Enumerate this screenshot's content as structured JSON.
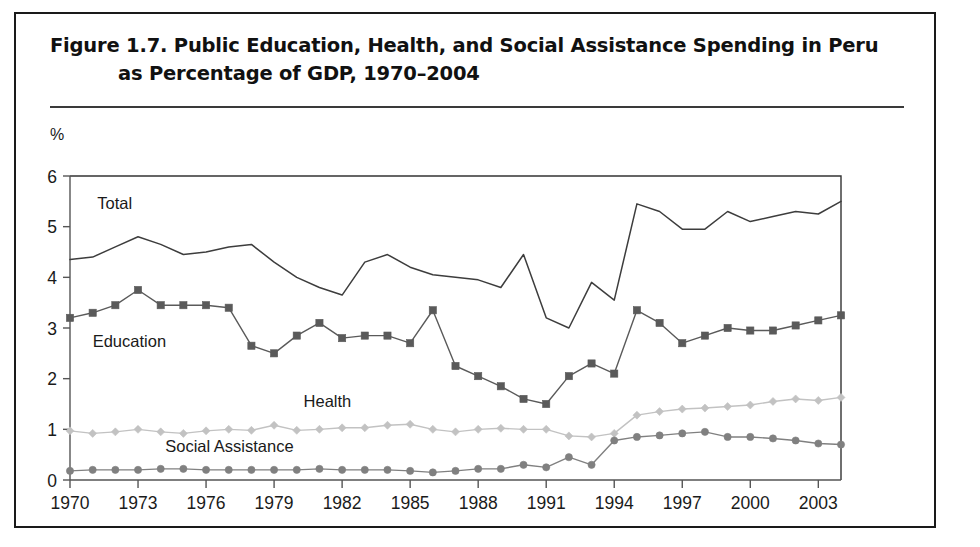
{
  "figure": {
    "title_line_1": "Figure 1.7.  Public Education, Health, and Social Assistance Spending in Peru",
    "title_line_2": "as Percentage of GDP, 1970–2004"
  },
  "chart_data": {
    "type": "line",
    "title": "Public Education, Health, and Social Assistance Spending in Peru as Percentage of GDP, 1970–2004",
    "xlabel": "",
    "ylabel": "%",
    "y_unit_label": "%",
    "xlim": [
      1970,
      2004
    ],
    "ylim": [
      0,
      6
    ],
    "y_ticks": [
      0,
      1,
      2,
      3,
      4,
      5,
      6
    ],
    "y_tick_labels": [
      "0",
      "1",
      "2",
      "3",
      "4",
      "5",
      "6"
    ],
    "x_ticks": [
      1970,
      1973,
      1976,
      1979,
      1982,
      1985,
      1988,
      1991,
      1994,
      1997,
      2000,
      2003
    ],
    "x_tick_labels": [
      "1970",
      "1973",
      "1976",
      "1979",
      "1982",
      "1985",
      "1988",
      "1991",
      "1994",
      "1997",
      "2000",
      "2003"
    ],
    "grid": false,
    "legend_position": "inline-annotations",
    "x": [
      1970,
      1971,
      1972,
      1973,
      1974,
      1975,
      1976,
      1977,
      1978,
      1979,
      1980,
      1981,
      1982,
      1983,
      1984,
      1985,
      1986,
      1987,
      1988,
      1989,
      1990,
      1991,
      1992,
      1993,
      1994,
      1995,
      1996,
      1997,
      1998,
      1999,
      2000,
      2001,
      2002,
      2003,
      2004
    ],
    "series": [
      {
        "name": "Total",
        "label": "Total",
        "color": "#3d3d3d",
        "marker": "none",
        "values": [
          4.35,
          4.4,
          4.6,
          4.8,
          4.65,
          4.45,
          4.5,
          4.6,
          4.65,
          4.3,
          4.0,
          3.8,
          3.65,
          4.3,
          4.45,
          4.2,
          4.05,
          4.0,
          3.95,
          3.8,
          4.45,
          3.2,
          3.0,
          3.9,
          3.55,
          5.45,
          5.3,
          4.95,
          4.95,
          5.3,
          5.1,
          5.2,
          5.3,
          5.25,
          5.5
        ]
      },
      {
        "name": "Education",
        "label": "Education",
        "color": "#5a5a5a",
        "marker": "square",
        "values": [
          3.2,
          3.3,
          3.45,
          3.75,
          3.45,
          3.45,
          3.45,
          3.4,
          2.65,
          2.5,
          2.85,
          3.1,
          2.8,
          2.85,
          2.85,
          2.7,
          3.35,
          2.25,
          2.05,
          1.85,
          1.6,
          1.5,
          2.05,
          2.3,
          2.1,
          3.35,
          3.1,
          2.7,
          2.85,
          3.0,
          2.95,
          2.95,
          3.05,
          3.15,
          3.25
        ]
      },
      {
        "name": "Health",
        "label": "Health",
        "color": "#c2c2c2",
        "marker": "diamond",
        "values": [
          0.97,
          0.92,
          0.95,
          1.0,
          0.95,
          0.92,
          0.97,
          1.0,
          0.98,
          1.08,
          0.98,
          1.0,
          1.03,
          1.03,
          1.08,
          1.1,
          1.0,
          0.95,
          1.0,
          1.02,
          1.0,
          1.0,
          0.87,
          0.85,
          0.92,
          1.28,
          1.35,
          1.4,
          1.42,
          1.45,
          1.48,
          1.55,
          1.6,
          1.57,
          1.63
        ]
      },
      {
        "name": "Social Assistance",
        "label": "Social Assistance",
        "color": "#808080",
        "marker": "circle",
        "values": [
          0.18,
          0.2,
          0.2,
          0.2,
          0.22,
          0.22,
          0.2,
          0.2,
          0.2,
          0.2,
          0.2,
          0.22,
          0.2,
          0.2,
          0.2,
          0.18,
          0.15,
          0.18,
          0.22,
          0.22,
          0.3,
          0.25,
          0.45,
          0.3,
          0.78,
          0.85,
          0.88,
          0.92,
          0.95,
          0.85,
          0.85,
          0.82,
          0.78,
          0.72,
          0.7
        ]
      }
    ],
    "annotations": [
      {
        "text": "Total",
        "x": 1971.2,
        "y": 5.35
      },
      {
        "text": "Education",
        "x": 1971.0,
        "y": 2.62
      },
      {
        "text": "Health",
        "x": 1980.3,
        "y": 1.45
      },
      {
        "text": "Social Assistance",
        "x": 1974.2,
        "y": 0.55
      }
    ]
  }
}
